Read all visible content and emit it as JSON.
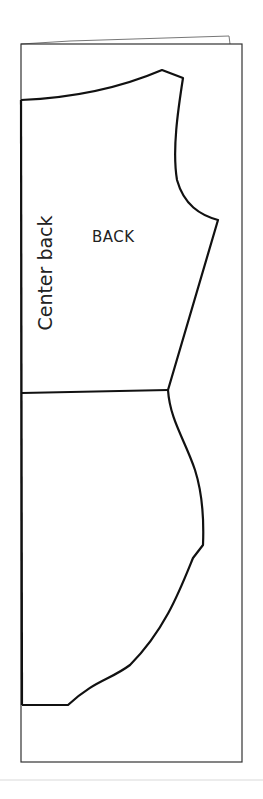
{
  "diagram": {
    "type": "sewing-pattern",
    "piece_label": "BACK",
    "edge_label": "Center back",
    "colors": {
      "line": "#111111",
      "frame": "#333333",
      "background": "#ffffff"
    }
  }
}
